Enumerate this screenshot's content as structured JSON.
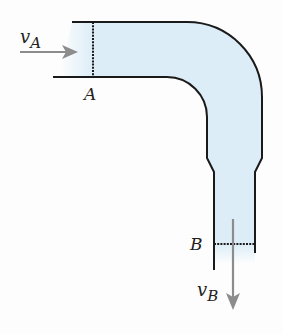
{
  "diagram": {
    "labels": {
      "section_a": "A",
      "section_b": "B",
      "velocity_a_symbol": "v",
      "velocity_a_subscript": "A",
      "velocity_b_symbol": "v",
      "velocity_b_subscript": "B"
    },
    "colors": {
      "fluid_fill": "#dcedf7",
      "pipe_wall": "#1a1a1a",
      "arrow": "#8c8c8c"
    }
  }
}
